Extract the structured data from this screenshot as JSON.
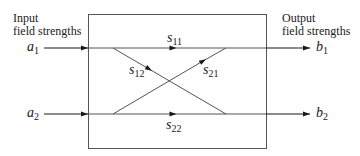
{
  "labels": {
    "input_line1": "Input",
    "input_line2": "field strengths",
    "output_line1": "Output",
    "output_line2": "field strengths"
  },
  "inputs": [
    {
      "symbol": "a",
      "sub": "1"
    },
    {
      "symbol": "a",
      "sub": "2"
    }
  ],
  "outputs": [
    {
      "symbol": "b",
      "sub": "1"
    },
    {
      "symbol": "b",
      "sub": "2"
    }
  ],
  "paths": [
    {
      "symbol": "s",
      "sub": "11"
    },
    {
      "symbol": "s",
      "sub": "12"
    },
    {
      "symbol": "s",
      "sub": "21"
    },
    {
      "symbol": "s",
      "sub": "22"
    }
  ],
  "colors": {
    "line": "#333333",
    "box": "#555555"
  }
}
